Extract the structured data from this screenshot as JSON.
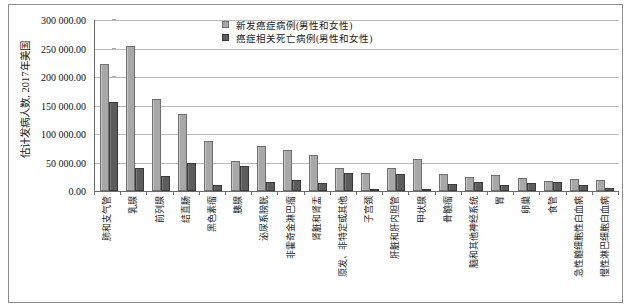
{
  "chart_data": {
    "type": "bar",
    "title": "",
    "xlabel": "",
    "ylabel": "估计发病人数, 2017年美国",
    "ylim": [
      0,
      300000
    ],
    "ytick_labels": [
      "300 000.00",
      "250 000.00",
      "200 000.00",
      "150 000.00",
      "100 000.00",
      "50 000.00",
      "0.00"
    ],
    "ytick_values": [
      300000,
      250000,
      200000,
      150000,
      100000,
      50000,
      0
    ],
    "grid": true,
    "legend_position": "top-right",
    "categories": [
      "肺和支气管",
      "乳腺",
      "前列腺",
      "结直肠",
      "黑色素瘤",
      "胰腺",
      "泌尿系膀胱",
      "非霍奇金淋巴瘤",
      "肾脏和肾盂",
      "原发、非特定或其他",
      "子宫颈",
      "肝脏和肝内胆管",
      "甲状腺",
      "骨髓瘤",
      "脑和其他神经系统",
      "胃",
      "卵巢",
      "食管",
      "急性髓细胞性白血病",
      "慢性淋巴细胞白血病"
    ],
    "series": [
      {
        "name": "新发癌症病例(男性和女性)",
        "color": "#a8a8a8",
        "values": [
          222500,
          255000,
          161000,
          135000,
          87000,
          53500,
          79000,
          72000,
          64000,
          40000,
          32000,
          41000,
          56500,
          30000,
          24000,
          28000,
          22500,
          17000,
          21000,
          20000
        ]
      },
      {
        "name": "癌症相关死亡病例(男性和女性)",
        "color": "#5c5c5c",
        "values": [
          155500,
          41000,
          26500,
          50000,
          9700,
          43500,
          16500,
          20000,
          14000,
          31000,
          4200,
          29000,
          2000,
          12500,
          16000,
          11000,
          14000,
          15000,
          10500,
          4500
        ]
      }
    ]
  },
  "legend": {
    "items": [
      {
        "label": "新发癌症病例(男性和女性)",
        "swatch": "light"
      },
      {
        "label": "癌症相关死亡病例(男性和女性)",
        "swatch": "dark"
      }
    ]
  }
}
